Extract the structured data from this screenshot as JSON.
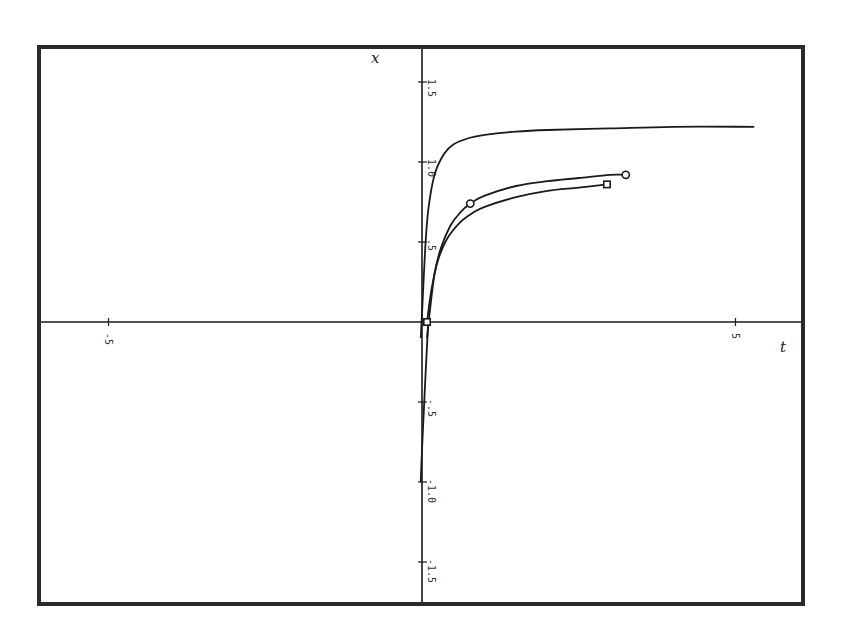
{
  "chart_data": {
    "type": "line",
    "title": "",
    "xlabel": "t",
    "ylabel": "x",
    "xlim": [
      -5,
      5.3
    ],
    "ylim": [
      -1.75,
      1.75
    ],
    "grid": false,
    "legend": null,
    "x_ticks": [
      {
        "value": -5,
        "label": "-5"
      },
      {
        "value": 5,
        "label": "5"
      }
    ],
    "y_ticks": [
      {
        "value": 1.5,
        "label": "1.5"
      },
      {
        "value": 1.0,
        "label": "1.0"
      },
      {
        "value": 0.5,
        "label": ".5"
      },
      {
        "value": -0.5,
        "label": "-.5"
      },
      {
        "value": -1.0,
        "label": "-1.0"
      },
      {
        "value": -1.5,
        "label": "-1.5"
      }
    ],
    "series": [
      {
        "name": "upper curve",
        "marker": "none",
        "x": [
          -0.02,
          0.0,
          0.05,
          0.1,
          0.2,
          0.35,
          0.5,
          0.75,
          1.0,
          1.5,
          2.0,
          3.0,
          4.0,
          5.3
        ],
        "y": [
          -0.1,
          0.05,
          0.45,
          0.7,
          0.92,
          1.05,
          1.11,
          1.15,
          1.17,
          1.19,
          1.2,
          1.21,
          1.22,
          1.22
        ]
      },
      {
        "name": "middle curve (circles)",
        "marker": "circle",
        "x": [
          0.08,
          0.12,
          0.2,
          0.3,
          0.45,
          0.6,
          0.77,
          1.0,
          1.5,
          2.0,
          2.5,
          3.0,
          3.25
        ],
        "y": [
          -0.1,
          0.05,
          0.3,
          0.46,
          0.6,
          0.68,
          0.74,
          0.79,
          0.85,
          0.88,
          0.9,
          0.92,
          0.92
        ],
        "marked_points": [
          {
            "x": 0.77,
            "y": 0.74
          },
          {
            "x": 3.25,
            "y": 0.92
          }
        ]
      },
      {
        "name": "lower curve (squares)",
        "marker": "square",
        "x": [
          0.08,
          0.15,
          0.25,
          0.4,
          0.6,
          0.8,
          1.0,
          1.5,
          2.0,
          2.5,
          2.95
        ],
        "y": [
          0.0,
          0.2,
          0.38,
          0.52,
          0.62,
          0.68,
          0.72,
          0.78,
          0.82,
          0.84,
          0.86
        ],
        "marked_points": [
          {
            "x": 0.08,
            "y": 0.0
          },
          {
            "x": 2.95,
            "y": 0.86
          }
        ]
      },
      {
        "name": "negative branch",
        "marker": "none",
        "x": [
          0.1,
          0.06,
          0.0,
          -0.02
        ],
        "y": [
          0.0,
          -0.3,
          -0.8,
          -1.0
        ]
      }
    ]
  },
  "frame": {
    "left": 39,
    "top": 47,
    "right": 803,
    "bottom": 604
  },
  "axes_px": {
    "x0": 422,
    "y0": 322,
    "px_per_t": 62.7,
    "px_per_x": 160
  },
  "colors": {
    "line": "#1a1a1a",
    "frame": "#2a2a2a",
    "background": "#ffffff"
  }
}
